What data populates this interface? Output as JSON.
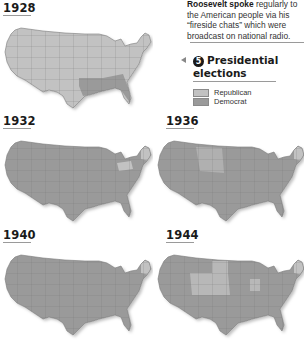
{
  "caption": {
    "bold": "Roosevelt spoke",
    "text": " regularly to the American people via his “fireside chats” which were broadcast on national radio."
  },
  "legend": {
    "number": "5",
    "title": "Presidential elections",
    "items": [
      {
        "label": "Republican",
        "color": "#c2c2c2"
      },
      {
        "label": "Democrat",
        "color": "#9a9a9a"
      }
    ]
  },
  "colors": {
    "republican": "#c2c2c2",
    "democrat": "#9a9a9a",
    "border": "#7a7a7a"
  },
  "maps": [
    {
      "year": "1928",
      "winner_majority": "Republican",
      "note": "Deep South states Democrat"
    },
    {
      "year": "1932",
      "winner_majority": "Democrat",
      "note": "Pennsylvania and northern New England Republican"
    },
    {
      "year": "1936",
      "winner_majority": "Democrat",
      "note": "Maine and Vermont Republican"
    },
    {
      "year": "1940",
      "winner_majority": "Democrat",
      "note": "Maine, Vermont and some Midwest states Republican"
    },
    {
      "year": "1944",
      "winner_majority": "Democrat",
      "note": "Several Plains and Midwest states, Maine and Vermont Republican"
    }
  ]
}
